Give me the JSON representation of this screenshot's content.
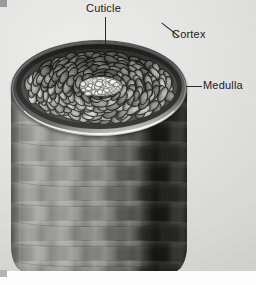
{
  "figure": {
    "background_color": "#e3e3e3"
  },
  "labels": [
    {
      "id": "cuticle",
      "text": "Cuticle",
      "leader": "vertical-line",
      "points_to": "outer-scale-layer"
    },
    {
      "id": "cortex",
      "text": "Cortex",
      "leader": "diagonal-line",
      "points_to": "packed-cell-field"
    },
    {
      "id": "medulla",
      "text": "Medulla",
      "leader": "horizontal-line",
      "points_to": "central-core"
    }
  ],
  "structure": {
    "cuticle_ring_color": "#2b2b29",
    "cortex_cell_color": "#8e8e8a",
    "medulla_color": "#dcdcd6",
    "shaft_color": "#8b8b88",
    "rim_highlight_color": "#f2f2ec"
  },
  "marks": {
    "corner_top_left": "#9a9a9a",
    "corner_bottom_left": "#b4b4b4",
    "bottom_band": "#fdfdfd"
  }
}
